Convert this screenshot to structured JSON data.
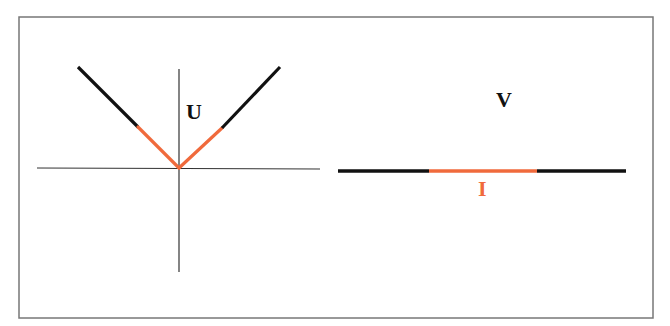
{
  "diagram": {
    "frame": {
      "x": 19,
      "y": 17,
      "width": 634,
      "height": 301,
      "stroke": "#777777"
    },
    "colors": {
      "black": "#111111",
      "accent": "#F06A3C",
      "axis": "#333333"
    },
    "left_panel": {
      "label": "U",
      "label_pos": {
        "x": 186,
        "y": 101
      },
      "axes": {
        "horizontal": {
          "x1": 37,
          "y1": 168,
          "x2": 320,
          "y2": 169
        },
        "vertical": {
          "x1": 179,
          "y1": 69,
          "x2": 179,
          "y2": 272
        }
      },
      "v_shape": {
        "vertex": [
          179,
          168
        ],
        "left_top": [
          78,
          67
        ],
        "left_transition": [
          138,
          127
        ],
        "right_transition": [
          222,
          128
        ],
        "right_top": [
          280,
          67
        ]
      }
    },
    "right_panel": {
      "top_label": "V",
      "top_label_pos": {
        "x": 496,
        "y": 89
      },
      "bottom_label": "I",
      "bottom_label_pos": {
        "x": 478,
        "y": 178
      },
      "line": {
        "x1": 338,
        "x2": 626,
        "y": 171
      },
      "accent_segment": {
        "x1": 429,
        "x2": 537
      }
    }
  }
}
